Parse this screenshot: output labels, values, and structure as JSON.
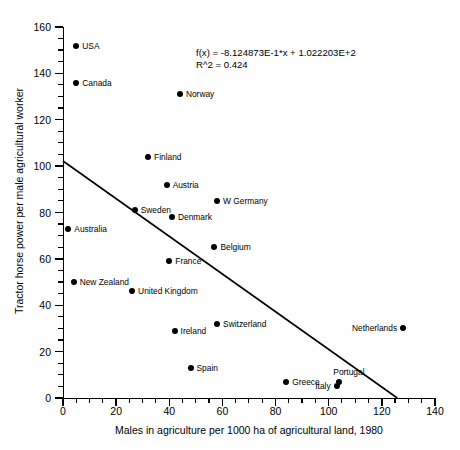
{
  "chart_data": {
    "type": "scatter",
    "title": "",
    "xlabel": "Males in agriculture per 1000 ha of agricultural land, 1980",
    "ylabel": "Tractor horse power per male agricultural worker",
    "xlim": [
      0,
      140
    ],
    "ylim": [
      0,
      160
    ],
    "xticks": [
      0,
      20,
      40,
      60,
      80,
      100,
      120,
      140
    ],
    "yticks": [
      0,
      20,
      40,
      60,
      80,
      100,
      120,
      140,
      160
    ],
    "x_minor_interval": 5,
    "y_minor_interval": 5,
    "grid": false,
    "legend": "none",
    "annotations": {
      "equation": "f(x) = -8.124873E-1*x + 1.022203E+2",
      "r_squared": "R^2 = 0.424"
    },
    "fit": {
      "type": "linear",
      "slope": -0.8124873,
      "intercept": 102.2203,
      "r2": 0.424,
      "x_start": 0,
      "y_start": 102.22,
      "x_end": 125.8,
      "y_end": 0
    },
    "points": [
      {
        "label": "USA",
        "x": 5,
        "y": 152,
        "label_side": "right"
      },
      {
        "label": "Canada",
        "x": 5,
        "y": 136,
        "label_side": "right"
      },
      {
        "label": "Norway",
        "x": 44,
        "y": 131,
        "label_side": "right"
      },
      {
        "label": "Finland",
        "x": 32,
        "y": 104,
        "label_side": "right"
      },
      {
        "label": "Austria",
        "x": 39,
        "y": 92,
        "label_side": "right"
      },
      {
        "label": "W Germany",
        "x": 58,
        "y": 85,
        "label_side": "right"
      },
      {
        "label": "Sweden",
        "x": 27,
        "y": 81,
        "label_side": "right"
      },
      {
        "label": "Denmark",
        "x": 41,
        "y": 78,
        "label_side": "right"
      },
      {
        "label": "Australia",
        "x": 2,
        "y": 73,
        "label_side": "right"
      },
      {
        "label": "Belgium",
        "x": 57,
        "y": 65,
        "label_side": "right"
      },
      {
        "label": "France",
        "x": 40,
        "y": 59,
        "label_side": "right"
      },
      {
        "label": "New Zealand",
        "x": 4,
        "y": 50,
        "label_side": "right"
      },
      {
        "label": "United Kingdom",
        "x": 26,
        "y": 46,
        "label_side": "right"
      },
      {
        "label": "Switzerland",
        "x": 58,
        "y": 32,
        "label_side": "right"
      },
      {
        "label": "Netherlands",
        "x": 128,
        "y": 30,
        "label_side": "left"
      },
      {
        "label": "Ireland",
        "x": 42,
        "y": 29,
        "label_side": "right"
      },
      {
        "label": "Spain",
        "x": 48,
        "y": 13,
        "label_side": "right"
      },
      {
        "label": "Greece",
        "x": 84,
        "y": 7,
        "label_side": "right"
      },
      {
        "label": "Portugal",
        "x": 104,
        "y": 7,
        "label_side": "above"
      },
      {
        "label": "Italy",
        "x": 103,
        "y": 5,
        "label_side": "left"
      }
    ]
  },
  "colors": {
    "axis": "#000000",
    "point": "#000000",
    "fit_line": "#000000",
    "background": "#ffffff"
  }
}
